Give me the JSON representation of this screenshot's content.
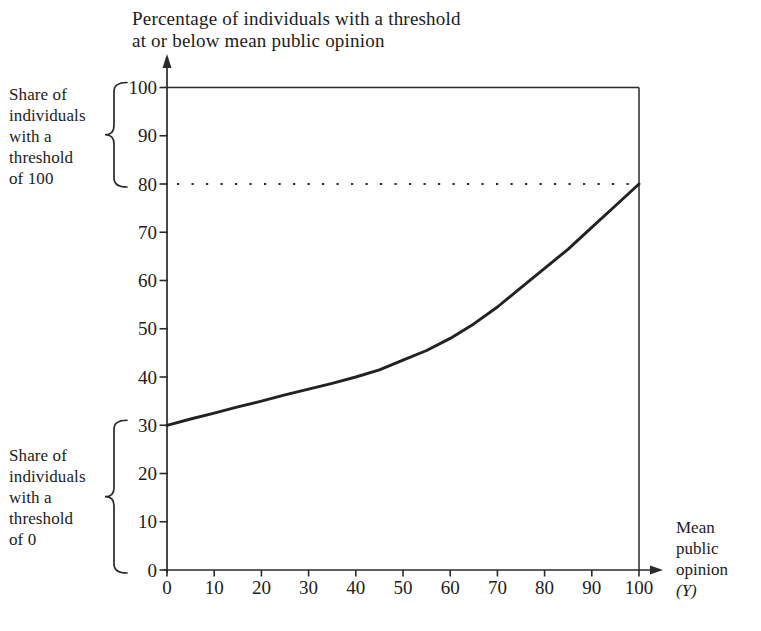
{
  "figure": {
    "background": "#ffffff",
    "text_color": "#1c1c1c",
    "line_color": "#2a2a2a"
  },
  "chart_data": {
    "type": "line",
    "title": "Percentage of individuals with a threshold at or below mean public opinion",
    "title_lines": [
      "Percentage of individuals with a threshold",
      "at or below mean public opinion"
    ],
    "x_axis": {
      "label_lines": "Mean\npublic\nopinion",
      "label_symbol": "(Y)",
      "ticks": [
        0,
        10,
        20,
        30,
        40,
        50,
        60,
        70,
        80,
        90,
        100
      ],
      "range": [
        0,
        100
      ]
    },
    "y_axis": {
      "ticks": [
        0,
        10,
        20,
        30,
        40,
        50,
        60,
        70,
        80,
        90,
        100
      ],
      "range": [
        0,
        100
      ]
    },
    "grid": "off",
    "plot_border": "top-and-right",
    "reference_line": {
      "y": 80,
      "style": "dotted"
    },
    "series": [
      {
        "name": "percentage-with-threshold-at-or-below-Y",
        "x": [
          0,
          5,
          10,
          15,
          20,
          25,
          30,
          35,
          40,
          45,
          50,
          55,
          60,
          65,
          70,
          75,
          80,
          85,
          90,
          95,
          100
        ],
        "y": [
          30,
          31.3,
          32.5,
          33.8,
          35,
          36.3,
          37.5,
          38.7,
          40,
          41.5,
          43.5,
          45.5,
          48,
          51,
          54.5,
          58.5,
          62.5,
          66.5,
          71,
          75.5,
          80
        ]
      }
    ],
    "annotations": [
      {
        "id": "threshold-100",
        "text": "Share of\nindividuals\nwith a\nthreshold\nof 100",
        "brace_y_from": 100,
        "brace_y_to": 80
      },
      {
        "id": "threshold-0",
        "text": "Share of\nindividuals\nwith a\nthreshold\nof 0",
        "brace_y_from": 30,
        "brace_y_to": 0
      }
    ]
  }
}
